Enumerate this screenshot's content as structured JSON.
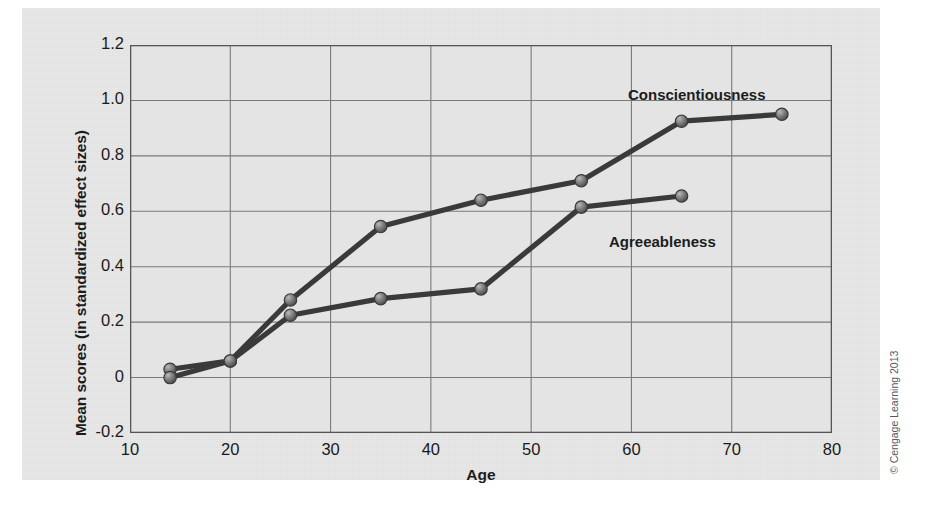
{
  "figure": {
    "credit": "© Cengage Learning 2013",
    "panel_color": "#e8e8e8",
    "line_color": "#3a3a3a",
    "marker_color": "#6e6e6e",
    "axis_color": "#555555",
    "grid_color": "#7a7a7a"
  },
  "chart_data": {
    "type": "line",
    "title": "",
    "xlabel": "Age",
    "ylabel": "Mean scores (in standardized effect sizes)",
    "xlim": [
      10,
      80
    ],
    "ylim": [
      -0.2,
      1.2
    ],
    "xticks": [
      10,
      20,
      30,
      40,
      50,
      60,
      70,
      80
    ],
    "xtick_labels": [
      "10",
      "20",
      "30",
      "40",
      "50",
      "60",
      "70",
      "80"
    ],
    "yticks": [
      1.2,
      1.0,
      0.8,
      0.6,
      0.4,
      0.2,
      0,
      -0.2
    ],
    "ytick_labels": [
      "1.2",
      "1.0",
      "0.8",
      "0.6",
      "0.4",
      "0.2",
      "0",
      "-0.2"
    ],
    "grid": true,
    "legend_position": "inline-annotations",
    "series": [
      {
        "name": "Conscientiousness",
        "label_x": 65,
        "label_y": 1.06,
        "x": [
          14,
          20,
          26,
          35,
          45,
          55,
          65,
          75
        ],
        "y": [
          0.03,
          0.06,
          0.28,
          0.545,
          0.64,
          0.71,
          0.925,
          0.95
        ]
      },
      {
        "name": "Agreeableness",
        "label_x": 58,
        "label_y": 0.5,
        "x": [
          14,
          20,
          26,
          35,
          45,
          55,
          65
        ],
        "y": [
          0.0,
          0.06,
          0.225,
          0.285,
          0.32,
          0.615,
          0.655
        ]
      }
    ]
  }
}
